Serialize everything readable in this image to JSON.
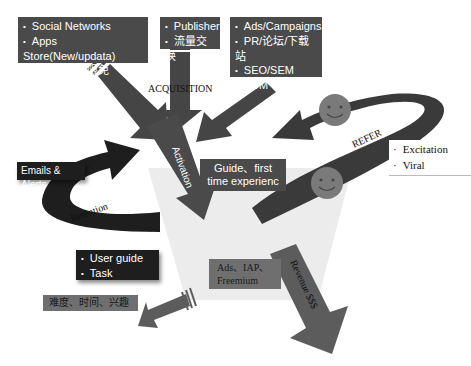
{
  "diagram": {
    "colors": {
      "box_dark": "#4a4a4a",
      "box_black": "#1e1e1e",
      "arrow_dark": "#404040",
      "arrow_mid": "#5a5a5a",
      "funnel_fill": "#ececec",
      "smiley_fill": "#7a7a7a"
    },
    "acquisition": {
      "label": "ACQUISITION",
      "sources": [
        {
          "items": [
            "Social Networks",
            "Apps Store(New/updata)",
            "冰点促销，限免"
          ]
        },
        {
          "items": [
            "Publisher",
            "流量交换"
          ]
        },
        {
          "items": [
            "Ads/Campaigns",
            "PR/论坛/下载站",
            "SEO/SEM",
            "EDM"
          ]
        }
      ]
    },
    "activation": {
      "label": "Activation",
      "note": "Guide、first time experienc"
    },
    "retention": {
      "label": "Retention",
      "trigger": "Emails & Alerts",
      "items": [
        "User guide",
        "Task"
      ]
    },
    "referral": {
      "label": "REFER",
      "items": [
        "Excitation",
        "Viral"
      ]
    },
    "revenue": {
      "label": "Revenue $$$",
      "note": "Ads、IAP、Freemium"
    },
    "churn": {
      "note": "难度、时间、兴趣"
    }
  }
}
